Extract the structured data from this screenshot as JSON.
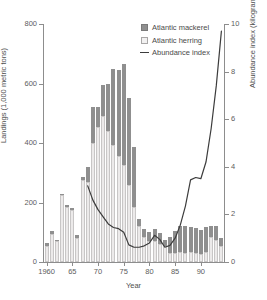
{
  "chart": {
    "title": "",
    "xlabel": "Year",
    "ylabel_left": "Landings (1,000 metric tons)",
    "ylabel_right": "Abundance index (kilograms per tow)"
  },
  "legend": {
    "position": "top-right",
    "items": [
      {
        "label": "Atlantic mackerel",
        "marker": "square",
        "color": "#8f8f8f"
      },
      {
        "label": "Atlantic herring",
        "marker": "square",
        "color": "#f2f1f1"
      },
      {
        "label": "Abundance index",
        "marker": "line",
        "color": "#3c3c3c"
      }
    ]
  },
  "axes": {
    "left": {
      "ticks": [
        0,
        200,
        400,
        600,
        800
      ],
      "tick_labels": [
        "0",
        "200",
        "400",
        "600",
        "800"
      ],
      "min": 0,
      "max": 800
    },
    "right": {
      "ticks": [
        0,
        2,
        4,
        6,
        8,
        10
      ],
      "tick_labels": [
        "0",
        "2",
        "4",
        "6",
        "8",
        "10"
      ],
      "min": 0,
      "max": 10
    },
    "bottom": {
      "ticks": [
        1960,
        1965,
        1970,
        1975,
        1980,
        1985,
        1990
      ],
      "tick_labels": [
        "1960",
        "65",
        "70",
        "75",
        "80",
        "85",
        "90"
      ],
      "min": 1959.3,
      "max": 1994.7
    }
  },
  "chart_data": {
    "type": "bar",
    "subtype": "stacked-bar-with-line-overlay",
    "title": "",
    "xlabel": "Year",
    "ylabel": "Landings (1,000 metric tons)",
    "ylabel_secondary": "Abundance index (kilograms per tow)",
    "ylim": [
      0,
      800
    ],
    "ylim_secondary": [
      0,
      10
    ],
    "xlim": [
      1959.3,
      1994.7
    ],
    "grid": false,
    "legend_position": "top-right",
    "categories": [
      1960,
      1961,
      1962,
      1963,
      1964,
      1965,
      1966,
      1967,
      1968,
      1969,
      1970,
      1971,
      1972,
      1973,
      1974,
      1975,
      1976,
      1977,
      1978,
      1979,
      1980,
      1981,
      1982,
      1983,
      1984,
      1985,
      1986,
      1987,
      1988,
      1989,
      1990,
      1991,
      1992,
      1993,
      1994
    ],
    "series": [
      {
        "name": "Atlantic herring",
        "type": "bar",
        "stack": "landings",
        "axis": "left",
        "color": "#eceaea",
        "values": [
          55,
          95,
          70,
          225,
          185,
          175,
          82,
          275,
          270,
          400,
          455,
          490,
          440,
          395,
          355,
          325,
          260,
          185,
          120,
          85,
          70,
          72,
          60,
          55,
          30,
          30,
          35,
          30,
          32,
          30,
          28,
          32,
          85,
          75,
          55
        ]
      },
      {
        "name": "Atlantic mackerel",
        "type": "bar",
        "stack": "landings",
        "axis": "left",
        "color": "#8f8f8f",
        "values": [
          10,
          8,
          5,
          5,
          5,
          5,
          8,
          10,
          50,
          120,
          65,
          105,
          160,
          255,
          290,
          340,
          290,
          200,
          25,
          25,
          30,
          40,
          38,
          20,
          55,
          75,
          85,
          90,
          85,
          85,
          80,
          85,
          35,
          45,
          25
        ]
      },
      {
        "name": "Abundance index",
        "type": "line",
        "axis": "right",
        "color": "#3c3c3c",
        "values": [
          null,
          null,
          null,
          null,
          null,
          null,
          null,
          null,
          3.2,
          2.6,
          2.2,
          1.9,
          1.6,
          1.45,
          1.4,
          1.25,
          0.72,
          0.62,
          0.62,
          0.68,
          0.8,
          1.12,
          0.95,
          0.62,
          0.7,
          1.0,
          1.55,
          2.35,
          3.45,
          3.55,
          3.5,
          4.2,
          5.6,
          7.4,
          9.7
        ]
      }
    ]
  }
}
